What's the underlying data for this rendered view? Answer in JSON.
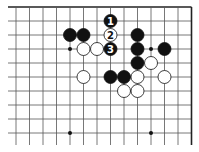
{
  "diagram": {
    "type": "go-board-fragment",
    "grid": {
      "columns": 14,
      "rows": 10,
      "origin_x": 16,
      "origin_y": 7,
      "spacing_x": 13.5,
      "spacing_y": 14,
      "extend_left_to": 8,
      "extend_bottom_to": 145,
      "edges": [
        "top",
        "right"
      ]
    },
    "colors": {
      "background": "#ffffff",
      "line": "#555555",
      "edge": "#222222",
      "black_stone": "#111111",
      "white_stone": "#ffffff",
      "stone_outline": "#111111"
    },
    "star_points": [
      {
        "col": 4,
        "row": 3
      },
      {
        "col": 10,
        "row": 3
      },
      {
        "col": 4,
        "row": 9
      },
      {
        "col": 10,
        "row": 9
      }
    ],
    "stones": [
      {
        "col": 4,
        "row": 2,
        "color": "black",
        "label": ""
      },
      {
        "col": 5,
        "row": 2,
        "color": "black",
        "label": ""
      },
      {
        "col": 5,
        "row": 3,
        "color": "white",
        "label": ""
      },
      {
        "col": 6,
        "row": 3,
        "color": "white",
        "label": ""
      },
      {
        "col": 7,
        "row": 1,
        "color": "black",
        "label": "1"
      },
      {
        "col": 7,
        "row": 2,
        "color": "white",
        "label": "2"
      },
      {
        "col": 7,
        "row": 3,
        "color": "black",
        "label": "3"
      },
      {
        "col": 9,
        "row": 2,
        "color": "black",
        "label": ""
      },
      {
        "col": 9,
        "row": 3,
        "color": "black",
        "label": ""
      },
      {
        "col": 9,
        "row": 4,
        "color": "black",
        "label": ""
      },
      {
        "col": 11,
        "row": 3,
        "color": "black",
        "label": ""
      },
      {
        "col": 10,
        "row": 4,
        "color": "white",
        "label": ""
      },
      {
        "col": 5,
        "row": 5,
        "color": "white",
        "label": ""
      },
      {
        "col": 7,
        "row": 5,
        "color": "black",
        "label": ""
      },
      {
        "col": 8,
        "row": 5,
        "color": "black",
        "label": ""
      },
      {
        "col": 9,
        "row": 5,
        "color": "white",
        "label": ""
      },
      {
        "col": 11,
        "row": 5,
        "color": "white",
        "label": ""
      },
      {
        "col": 8,
        "row": 6,
        "color": "white",
        "label": ""
      },
      {
        "col": 9,
        "row": 6,
        "color": "white",
        "label": ""
      }
    ]
  }
}
